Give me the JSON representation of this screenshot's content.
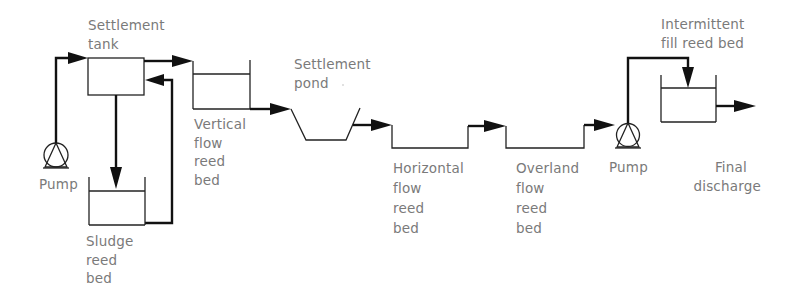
{
  "diagram": {
    "title": "",
    "colors": {
      "line": "#111111",
      "text": "#7a7a7a",
      "background": "#ffffff"
    },
    "labels": {
      "settlement_tank": [
        "Settlement",
        "tank"
      ],
      "pump_left": [
        "Pump"
      ],
      "sludge_bed": [
        "Sludge",
        "reed",
        "bed"
      ],
      "vertical_bed": [
        "Vertical",
        "flow",
        "reed",
        "bed"
      ],
      "settlement_pond": [
        "Settlement",
        "pond"
      ],
      "horizontal_bed": [
        "Horizontal",
        "flow",
        "reed",
        "bed"
      ],
      "overland_bed": [
        "Overland",
        "flow",
        "reed",
        "bed"
      ],
      "pump_right": [
        "Pump"
      ],
      "intermittent_bed": [
        "Intermittent",
        "fill reed bed"
      ],
      "final_discharge": [
        "Final",
        "discharge"
      ]
    },
    "nodes": [
      {
        "id": "pump_left",
        "type": "pump",
        "label": "Pump"
      },
      {
        "id": "settlement_tank",
        "type": "tank",
        "label": "Settlement tank"
      },
      {
        "id": "sludge_bed",
        "type": "reed-bed",
        "label": "Sludge reed bed"
      },
      {
        "id": "vertical_bed",
        "type": "reed-bed",
        "label": "Vertical flow reed bed"
      },
      {
        "id": "settlement_pond",
        "type": "pond",
        "label": "Settlement pond"
      },
      {
        "id": "horizontal_bed",
        "type": "reed-bed",
        "label": "Horizontal flow reed bed"
      },
      {
        "id": "overland_bed",
        "type": "reed-bed",
        "label": "Overland flow reed bed"
      },
      {
        "id": "pump_right",
        "type": "pump",
        "label": "Pump"
      },
      {
        "id": "intermittent_bed",
        "type": "reed-bed",
        "label": "Intermittent fill reed bed"
      },
      {
        "id": "final_discharge",
        "type": "outlet",
        "label": "Final discharge"
      }
    ],
    "edges": [
      {
        "from": "pump_left",
        "to": "settlement_tank"
      },
      {
        "from": "settlement_tank",
        "to": "vertical_bed"
      },
      {
        "from": "settlement_tank",
        "to": "sludge_bed"
      },
      {
        "from": "sludge_bed",
        "to": "settlement_tank"
      },
      {
        "from": "vertical_bed",
        "to": "settlement_pond"
      },
      {
        "from": "settlement_pond",
        "to": "horizontal_bed"
      },
      {
        "from": "horizontal_bed",
        "to": "overland_bed"
      },
      {
        "from": "overland_bed",
        "to": "pump_right"
      },
      {
        "from": "pump_right",
        "to": "intermittent_bed"
      },
      {
        "from": "intermittent_bed",
        "to": "final_discharge"
      }
    ]
  }
}
